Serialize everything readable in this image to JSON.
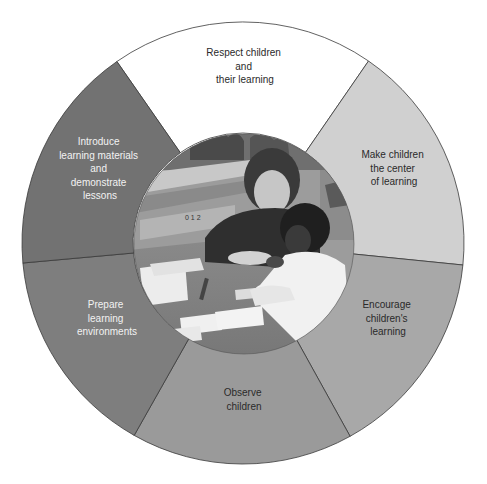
{
  "diagram": {
    "type": "segmented-wheel",
    "center_image": {
      "description": "Black-and-white photo of a teacher and a young child working together at a table with learning cards and materials"
    },
    "segments": [
      {
        "id": "respect",
        "lines": [
          "Respect children",
          "and",
          "their learning"
        ],
        "fill": "#ffffff",
        "text_color": "dark"
      },
      {
        "id": "center",
        "lines": [
          "Make children",
          "the center",
          "of learning"
        ],
        "fill": "#d0d0d0",
        "text_color": "dark"
      },
      {
        "id": "encourage",
        "lines": [
          "Encourage",
          "children's",
          "learning"
        ],
        "fill": "#a8a8a8",
        "text_color": "dark"
      },
      {
        "id": "observe",
        "lines": [
          "Observe",
          "children"
        ],
        "fill": "#9a9a9a",
        "text_color": "dark"
      },
      {
        "id": "prepare",
        "lines": [
          "Prepare",
          "learning",
          "environments"
        ],
        "fill": "#7e7e7e",
        "text_color": "light"
      },
      {
        "id": "introduce",
        "lines": [
          "Introduce",
          "learning materials",
          "and",
          "demonstrate",
          "lessons"
        ],
        "fill": "#727272",
        "text_color": "light"
      }
    ]
  }
}
